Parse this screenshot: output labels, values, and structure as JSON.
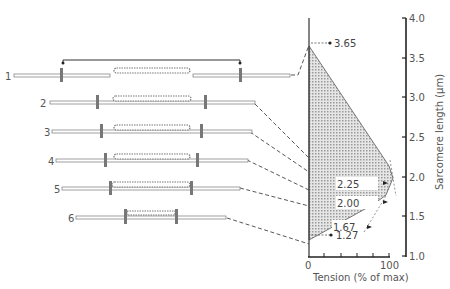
{
  "diagram": {
    "sarcomeres": [
      {
        "label": "1",
        "length_um": 3.65
      },
      {
        "label": "2",
        "length_um": 2.85
      },
      {
        "label": "3",
        "length_um": 2.4
      },
      {
        "label": "4",
        "length_um": 2.25
      },
      {
        "label": "5",
        "length_um": 2.0
      },
      {
        "label": "6",
        "length_um": 1.67
      }
    ],
    "annotations": {
      "a365": "3.65",
      "a225": "2.25",
      "a200": "2.00",
      "a167": "1.67",
      "a127": "1.27"
    },
    "axes": {
      "x_label": "Tension (% of max)",
      "x_ticks": [
        "0",
        "100"
      ],
      "y_label": "Sarcomere length (μm)",
      "y_ticks": [
        "1.0",
        "1.5",
        "2.0",
        "2.5",
        "3.0",
        "3.5",
        "4.0"
      ]
    },
    "curve_points": [
      {
        "length": 3.65,
        "tension": 0
      },
      {
        "length": 2.25,
        "tension": 100
      },
      {
        "length": 2.0,
        "tension": 100
      },
      {
        "length": 1.67,
        "tension": 80
      },
      {
        "length": 1.27,
        "tension": 0
      }
    ]
  }
}
